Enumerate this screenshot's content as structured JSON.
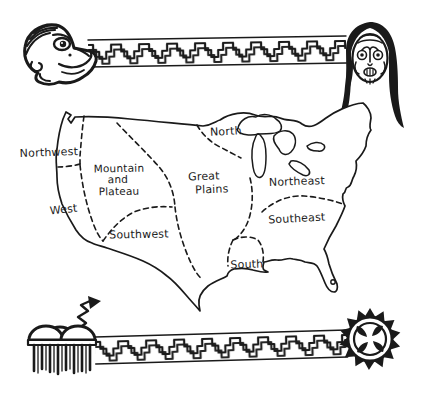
{
  "map": {
    "labels": {
      "northwest": "Northwest",
      "west": "West",
      "mountain_line1": "Mountain",
      "mountain_line2": "and",
      "mountain_line3": "Plateau",
      "great_plains_line1": "Great",
      "great_plains_line2": "Plains",
      "north": "North",
      "northeast": "Northeast",
      "southeast": "Southeast",
      "southwest": "Southwest",
      "south": "South"
    }
  },
  "decorations": {
    "top_left_icon": "eagle-head-carving",
    "top_right_icon": "mask-with-long-hair",
    "bottom_left_icon": "lodge-with-smoke-arrow",
    "bottom_right_icon": "sun-pinwheel-symbol",
    "border_pattern": "step-fret-band"
  },
  "colors": {
    "ink": "#1a1a1a",
    "paper": "#ffffff"
  }
}
